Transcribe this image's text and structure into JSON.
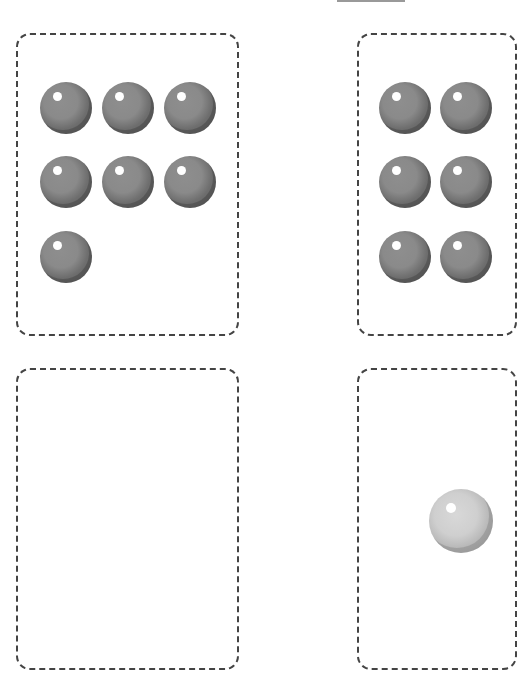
{
  "worksheet": {
    "answer_blank": "",
    "cards": [
      {
        "id": "card-1",
        "ball_count": 7,
        "ball_style": "dark-gray"
      },
      {
        "id": "card-2",
        "ball_count_visible": 6,
        "ball_style": "dark-gray",
        "cropped": true
      },
      {
        "id": "card-3",
        "ball_count": 0,
        "empty": true
      },
      {
        "id": "card-4",
        "ball_count_visible": 1,
        "ball_style": "light-gray",
        "cropped": true
      }
    ]
  },
  "colors": {
    "border": "#444444",
    "ball_dark": "#6e6e6e",
    "ball_light": "#c8c8c8",
    "background": "#ffffff"
  }
}
